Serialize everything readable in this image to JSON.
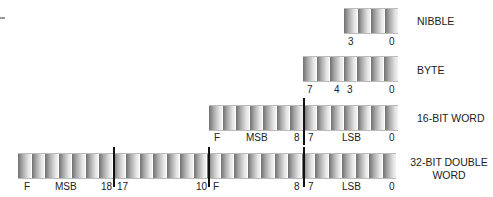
{
  "diagram": {
    "registers": [
      {
        "name": "NIBBLE",
        "cells": 4,
        "labels": [
          "3",
          "0"
        ]
      },
      {
        "name": "BYTE",
        "cells": 7,
        "labels": [
          "7",
          "4",
          "3",
          "0"
        ]
      },
      {
        "name": "16-BIT WORD",
        "cells": 14,
        "labels": [
          "F",
          "MSB",
          "8",
          "7",
          "LSB",
          "0"
        ]
      },
      {
        "name_line1": "32-BIT DOUBLE",
        "name_line2": "WORD",
        "cells": 28,
        "labels": [
          "F",
          "MSB",
          "18",
          "17",
          "10",
          "F",
          "8",
          "7",
          "LSB",
          "0"
        ]
      }
    ]
  }
}
